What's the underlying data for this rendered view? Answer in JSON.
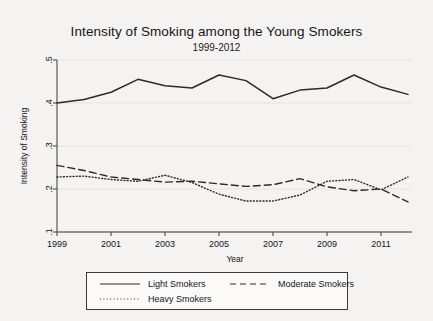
{
  "chart_data": {
    "type": "line",
    "title": "Intensity of Smoking among the Young Smokers",
    "subtitle": "1999-2012",
    "xlabel": "Year",
    "ylabel": "Intensity of Smoking",
    "xlim": [
      1999,
      2012
    ],
    "ylim": [
      0.1,
      0.5
    ],
    "xticks": [
      1999,
      2001,
      2003,
      2005,
      2007,
      2009,
      2011
    ],
    "xtick_labels": [
      "1999",
      "2001",
      "2003",
      "2005",
      "2007",
      "2009",
      "2011"
    ],
    "yticks": [
      0.1,
      0.2,
      0.3,
      0.4,
      0.5
    ],
    "ytick_labels": [
      ".1",
      ".2",
      ".3",
      ".4",
      ".5"
    ],
    "grid": "horizontal-faint",
    "legend_position": "bottom",
    "x": [
      1999,
      2000,
      2001,
      2002,
      2003,
      2004,
      2005,
      2006,
      2007,
      2008,
      2009,
      2010,
      2011,
      2012
    ],
    "series": [
      {
        "name": "Light Smokers",
        "style": "solid",
        "color": "#2b2b2b",
        "values": [
          0.4,
          0.408,
          0.425,
          0.455,
          0.44,
          0.435,
          0.465,
          0.452,
          0.41,
          0.43,
          0.435,
          0.465,
          0.437,
          0.42
        ]
      },
      {
        "name": "Moderate Smokers",
        "style": "dashed",
        "color": "#2b2b2b",
        "values": [
          0.255,
          0.243,
          0.228,
          0.222,
          0.216,
          0.218,
          0.212,
          0.206,
          0.21,
          0.224,
          0.205,
          0.196,
          0.2,
          0.17
        ]
      },
      {
        "name": "Heavy Smokers",
        "style": "dotted",
        "color": "#2b2b2b",
        "values": [
          0.228,
          0.23,
          0.222,
          0.218,
          0.232,
          0.215,
          0.188,
          0.172,
          0.172,
          0.186,
          0.218,
          0.222,
          0.198,
          0.228
        ]
      }
    ]
  },
  "legend": {
    "items": [
      {
        "label": "Light Smokers",
        "style": "solid"
      },
      {
        "label": "Moderate Smokers",
        "style": "dashed"
      },
      {
        "label": "Heavy Smokers",
        "style": "dotted"
      }
    ]
  }
}
